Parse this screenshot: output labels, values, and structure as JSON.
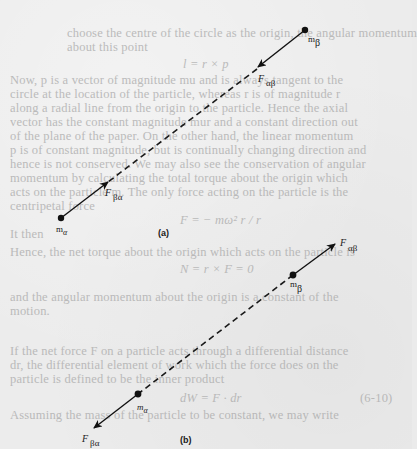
{
  "figure": {
    "panels": [
      {
        "caption": "(a)",
        "particle_top": {
          "mass_label": "m",
          "mass_sub": "β"
        },
        "particle_bottom": {
          "mass_label": "m",
          "mass_sub": "α"
        },
        "force_on_beta": {
          "label": "F",
          "sub": "αβ",
          "direction": "toward m_alpha (attractive)"
        },
        "force_on_alpha": {
          "label": "F",
          "sub": "βα",
          "direction": "toward m_beta (attractive)"
        }
      },
      {
        "caption": "(b)",
        "particle_top": {
          "mass_label": "m",
          "mass_sub": "β"
        },
        "particle_bottom": {
          "mass_label": "m",
          "mass_sub": "α"
        },
        "force_on_beta": {
          "label": "F",
          "sub": "αβ",
          "direction": "away from m_alpha (repulsive)"
        },
        "force_on_alpha": {
          "label": "F",
          "sub": "βα",
          "direction": "away from m_beta (repulsive)"
        }
      }
    ]
  },
  "show_through_text": {
    "lines": [
      "choose the centre of the circle as the origin, the angular momentum",
      "about this point",
      "l = r × p",
      "Now, p is a vector of magnitude mu and is always tangent to the",
      "circle at the location of the particle, whereas r is of magnitude r",
      "along a radial line from the origin to the particle.  Hence the axial",
      "vector has the constant magnitude mur and a constant direction out",
      "of the plane of the paper.  On the other hand, the linear momentum",
      "p is of constant magnitude, but is continually changing direction and",
      "hence is not conserved.  We may also see the conservation of angular",
      "momentum by calculating the total torque about the origin which",
      "acts on the particle m.  The only force acting on the particle is the",
      "centripetal force",
      "F = − mω² r / r",
      "It then",
      "Hence, the net torque about the origin which acts on the particle is",
      "N = r × F = 0",
      "and the angular momentum about the origin is a constant of the",
      "motion.",
      "If the net force F on a particle acts through a differential distance",
      "dr, the differential element of work which the force does on the",
      "particle is defined to be the inner product",
      "dW = F · dr",
      "(6-10)",
      "Assuming the mass of the particle to be constant, we may write"
    ]
  }
}
